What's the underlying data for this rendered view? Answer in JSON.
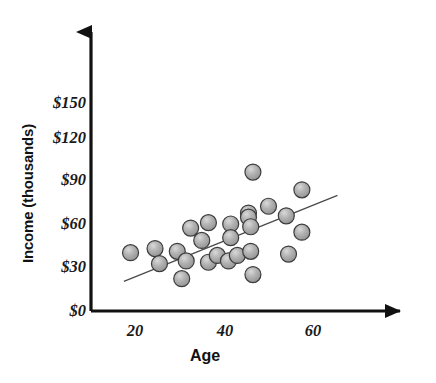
{
  "chart_data": {
    "type": "scatter",
    "title": "",
    "xlabel": "Age",
    "ylabel": "Income (thousands)",
    "xlim": [
      0,
      72
    ],
    "ylim": [
      0,
      165
    ],
    "xticks": [
      20,
      40,
      60
    ],
    "xtick_labels": [
      "20",
      "40",
      "60"
    ],
    "yticks": [
      0,
      30,
      60,
      90,
      120,
      150
    ],
    "ytick_labels": [
      "$0",
      "$30",
      "$60",
      "$90",
      "$120",
      "$150"
    ],
    "grid": false,
    "legend": null,
    "marker": {
      "shape": "circle",
      "fill": "#9a9a9a",
      "edge": "#3c3c3c",
      "highlight": "#d8d8d8",
      "radius_px": 8
    },
    "points": [
      {
        "x": 19.0,
        "y": 39.0
      },
      {
        "x": 24.5,
        "y": 42.0
      },
      {
        "x": 25.5,
        "y": 31.0
      },
      {
        "x": 29.5,
        "y": 40.0
      },
      {
        "x": 30.5,
        "y": 20.0
      },
      {
        "x": 31.5,
        "y": 33.0
      },
      {
        "x": 32.5,
        "y": 57.0
      },
      {
        "x": 35.0,
        "y": 48.0
      },
      {
        "x": 36.5,
        "y": 61.0
      },
      {
        "x": 36.5,
        "y": 32.0
      },
      {
        "x": 38.5,
        "y": 37.0
      },
      {
        "x": 41.0,
        "y": 33.0
      },
      {
        "x": 41.5,
        "y": 60.0
      },
      {
        "x": 41.5,
        "y": 50.0
      },
      {
        "x": 43.0,
        "y": 37.0
      },
      {
        "x": 45.5,
        "y": 68.0
      },
      {
        "x": 45.5,
        "y": 65.0
      },
      {
        "x": 46.0,
        "y": 58.0
      },
      {
        "x": 46.0,
        "y": 40.0
      },
      {
        "x": 46.5,
        "y": 98.0
      },
      {
        "x": 46.5,
        "y": 23.0
      },
      {
        "x": 50.0,
        "y": 73.0
      },
      {
        "x": 54.0,
        "y": 66.0
      },
      {
        "x": 54.5,
        "y": 38.0
      },
      {
        "x": 57.5,
        "y": 85.0
      },
      {
        "x": 57.5,
        "y": 54.0
      }
    ],
    "trendline": {
      "type": "linear",
      "x_start": 17.5,
      "y_start": 18.0,
      "x_end": 65.5,
      "y_end": 81.0,
      "color": "#4a4a4a"
    }
  },
  "axes": {
    "x_arrow": "arrow-right",
    "y_arrow": "arrow-up",
    "axis_color": "#111111"
  },
  "caption": {
    "text": ""
  }
}
